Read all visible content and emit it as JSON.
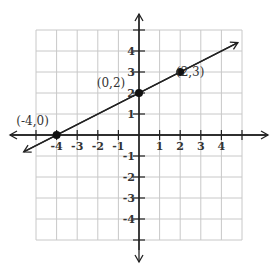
{
  "chart_data": {
    "type": "line",
    "title": "",
    "xlabel": "",
    "ylabel": "",
    "xlim": [
      -5,
      5
    ],
    "ylim": [
      -5,
      5
    ],
    "grid": true,
    "x_ticks": [
      "-4",
      "-3",
      "-2",
      "-1",
      "1",
      "2",
      "3",
      "4"
    ],
    "y_ticks": [
      "4",
      "3",
      "2",
      "1",
      "-1",
      "-2",
      "-3",
      "-4"
    ],
    "series": [
      {
        "name": "line",
        "equation": "y = 0.5x + 2",
        "points": [
          {
            "x": -4,
            "y": 0,
            "label": "(-4,0)"
          },
          {
            "x": 0,
            "y": 2,
            "label": "(0,2)"
          },
          {
            "x": 2,
            "y": 3,
            "label": "(2,3)"
          }
        ]
      }
    ]
  }
}
